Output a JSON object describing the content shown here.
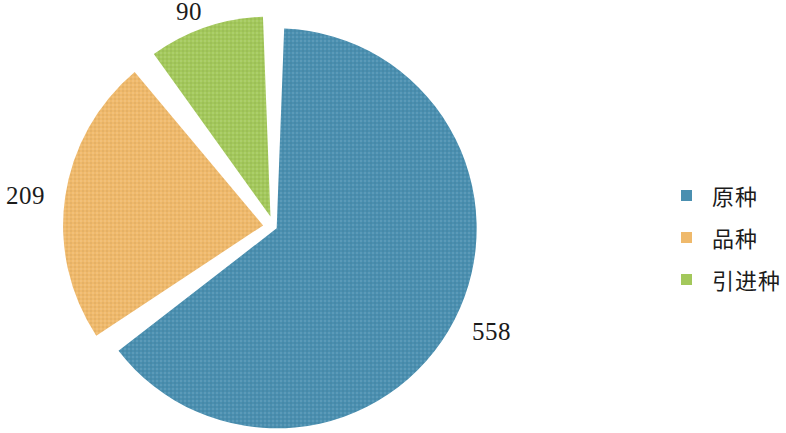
{
  "chart_data": {
    "type": "pie",
    "title": "",
    "subtitle": "",
    "xlabel": "",
    "ylabel": "",
    "legend_position": "right",
    "grid": false,
    "categories": [
      "原种",
      "品种",
      "引进种"
    ],
    "values": [
      558,
      209,
      90
    ],
    "total": 857,
    "colors": [
      "#4a8fb0",
      "#efb96b",
      "#a3c85b"
    ],
    "start_angle_deg": 0,
    "direction": "clockwise",
    "exploded": true,
    "slices": [
      {
        "label": "原种",
        "value": 558,
        "value_text": "558",
        "color": "#4a8fb0",
        "percent": "65.1",
        "start_deg": 0,
        "end_deg": 234.4
      },
      {
        "label": "品种",
        "value": 209,
        "value_text": "209",
        "color": "#efb96b",
        "percent": "24.4",
        "start_deg": 234.4,
        "end_deg": 322.2
      },
      {
        "label": "引进种",
        "value": 90,
        "value_text": "90",
        "color": "#a3c85b",
        "percent": "10.5",
        "start_deg": 322.2,
        "end_deg": 360
      }
    ],
    "data_labels": [
      "558",
      "209",
      "90"
    ]
  },
  "chart": {
    "labels": {
      "blue_value": "558",
      "orange_value": "209",
      "green_value": "90"
    }
  },
  "legend": {
    "items": [
      {
        "label": "原种",
        "color": "#4a8fb0"
      },
      {
        "label": "品种",
        "color": "#efb96b"
      },
      {
        "label": "引进种",
        "color": "#a3c85b"
      }
    ]
  },
  "colors": {
    "blue": "#4a8fb0",
    "orange": "#efb96b",
    "green": "#a3c85b",
    "background": "#ffffff",
    "text": "#1b1b1b"
  }
}
